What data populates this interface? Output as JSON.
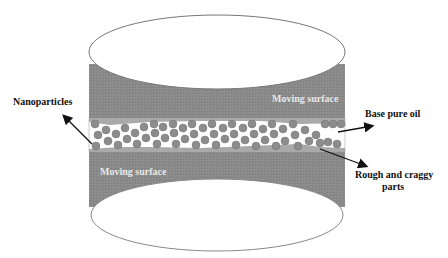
{
  "diagram": {
    "labels": {
      "nanoparticles": "Nanoparticles",
      "moving_surface_top": "Moving surface",
      "moving_surface_bottom": "Moving surface",
      "base_pure_oil": "Base pure oil",
      "rough_line1": "Rough and craggy",
      "rough_line2": "parts"
    },
    "colors": {
      "surface": "#8a8a8a",
      "oil_band": "#a9a9a9",
      "particle": "#8c8c8c",
      "gap": "#ffffff",
      "arrow": "#111111"
    }
  }
}
